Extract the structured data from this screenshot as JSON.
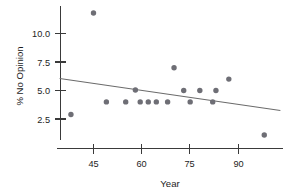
{
  "chart_data": {
    "type": "scatter",
    "title": "",
    "xlabel": "Year",
    "ylabel": "% No Opinion",
    "xlim": [
      33,
      103
    ],
    "ylim": [
      0.3,
      12.6
    ],
    "grid": false,
    "legend": null,
    "x_ticks": [
      45,
      60,
      75,
      90
    ],
    "x_tick_labels": [
      "45",
      "60",
      "75",
      "90"
    ],
    "y_ticks": [
      2.5,
      5.0,
      7.5,
      10.0
    ],
    "y_tick_labels": [
      "2.5",
      "5.0",
      "7.5",
      "10.0"
    ],
    "points": [
      {
        "x": 38,
        "y": 2.9
      },
      {
        "x": 45,
        "y": 11.8
      },
      {
        "x": 49,
        "y": 4.0
      },
      {
        "x": 55,
        "y": 4.0
      },
      {
        "x": 58,
        "y": 5.05
      },
      {
        "x": 59.5,
        "y": 4.0
      },
      {
        "x": 62,
        "y": 4.0
      },
      {
        "x": 64.5,
        "y": 4.0
      },
      {
        "x": 68,
        "y": 4.0
      },
      {
        "x": 70,
        "y": 7.0
      },
      {
        "x": 73,
        "y": 5.0
      },
      {
        "x": 75,
        "y": 4.0
      },
      {
        "x": 78,
        "y": 5.0
      },
      {
        "x": 82,
        "y": 4.0
      },
      {
        "x": 83,
        "y": 5.0
      },
      {
        "x": 87,
        "y": 6.0
      },
      {
        "x": 98,
        "y": 1.1
      }
    ],
    "trend_line": {
      "type": "linear-fit",
      "x_start": 34.5,
      "y_start": 6.05,
      "x_end": 103,
      "y_end": 3.25
    },
    "colors": {
      "point": "#6e6e75",
      "trend_line": "#6b6b6b",
      "axis": "#3a3a3a",
      "text": "#1c1c1c",
      "background": "#ffffff"
    }
  }
}
